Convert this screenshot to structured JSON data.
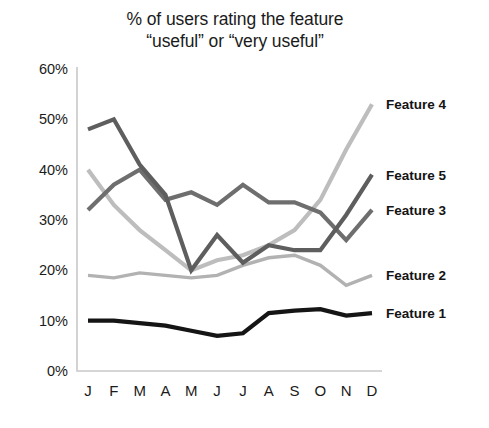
{
  "chart_data": {
    "type": "line",
    "title": "% of users rating the feature\n“useful” or “very useful”",
    "xlabel": "",
    "ylabel": "",
    "categories": [
      "J",
      "F",
      "M",
      "A",
      "M",
      "J",
      "J",
      "A",
      "S",
      "O",
      "N",
      "D"
    ],
    "ylim": [
      0,
      60
    ],
    "ytick_labels": [
      "0%",
      "10%",
      "20%",
      "30%",
      "40%",
      "50%",
      "60%"
    ],
    "ytick_values": [
      0,
      10,
      20,
      30,
      40,
      50,
      60
    ],
    "grid": false,
    "legend_position": "right-of-plot-at-series-end",
    "series": [
      {
        "name": "Feature 1",
        "color": "#151515",
        "width": 4.2,
        "values": [
          10,
          10,
          9.5,
          9,
          8,
          7,
          7.5,
          11.5,
          12,
          12.3,
          11,
          11.5
        ]
      },
      {
        "name": "Feature 2",
        "color": "#b2b2b2",
        "width": 3.4,
        "values": [
          19,
          18.5,
          19.5,
          19,
          18.5,
          19,
          21,
          22.5,
          23,
          21,
          17,
          19
        ]
      },
      {
        "name": "Feature 3",
        "color": "#6e6e6e",
        "width": 4.2,
        "values": [
          32,
          37,
          40,
          34,
          35.5,
          33,
          37,
          33.5,
          33.5,
          31.5,
          26,
          32
        ]
      },
      {
        "name": "Feature 4",
        "color": "#bdbdbd",
        "width": 4.2,
        "values": [
          40,
          33,
          28,
          24,
          20,
          22,
          23,
          25,
          28,
          34,
          44,
          53
        ]
      },
      {
        "name": "Feature 5",
        "color": "#5e5e5e",
        "width": 4.2,
        "values": [
          48,
          50,
          41,
          35,
          20,
          27,
          21.5,
          25,
          24,
          24,
          31,
          39
        ]
      }
    ],
    "legend": [
      {
        "label": "Feature 4",
        "value_at_end": 53
      },
      {
        "label": "Feature 5",
        "value_at_end": 39
      },
      {
        "label": "Feature 3",
        "value_at_end": 32
      },
      {
        "label": "Feature 2",
        "value_at_end": 19
      },
      {
        "label": "Feature 1",
        "value_at_end": 11.5
      }
    ]
  }
}
